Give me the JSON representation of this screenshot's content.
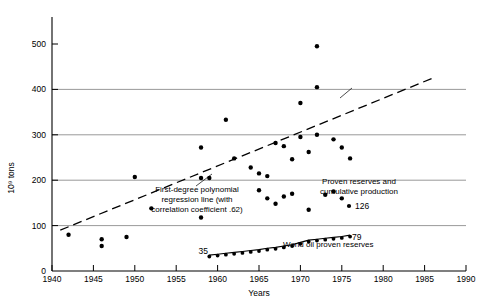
{
  "chart_data": {
    "type": "scatter",
    "title": "",
    "xlabel": "Years",
    "ylabel": "10⁹ tons",
    "xlim": [
      1940,
      1990
    ],
    "ylim": [
      0,
      560
    ],
    "grid": "horizontal gridlines at 100, 200, 300, 400",
    "legend_position": "inline annotations",
    "x_ticks": [
      1940,
      1945,
      1950,
      1955,
      1960,
      1965,
      1970,
      1975,
      1980,
      1985,
      1990
    ],
    "y_ticks": [
      0,
      100,
      200,
      300,
      400,
      500
    ],
    "series": [
      {
        "name": "Proven reserves and cumulative production",
        "type": "scatter",
        "points": [
          [
            1942,
            80
          ],
          [
            1946,
            55
          ],
          [
            1946,
            70
          ],
          [
            1949,
            75
          ],
          [
            1950,
            207
          ],
          [
            1952,
            138
          ],
          [
            1958,
            118
          ],
          [
            1958,
            205
          ],
          [
            1958,
            272
          ],
          [
            1959,
            205
          ],
          [
            1961,
            333
          ],
          [
            1962,
            248
          ],
          [
            1964,
            228
          ],
          [
            1965,
            215
          ],
          [
            1965,
            178
          ],
          [
            1966,
            160
          ],
          [
            1966,
            209
          ],
          [
            1967,
            148
          ],
          [
            1967,
            282
          ],
          [
            1968,
            164
          ],
          [
            1968,
            275
          ],
          [
            1969,
            170
          ],
          [
            1969,
            246
          ],
          [
            1970,
            295
          ],
          [
            1970,
            370
          ],
          [
            1971,
            135
          ],
          [
            1971,
            262
          ],
          [
            1972,
            300
          ],
          [
            1972,
            405
          ],
          [
            1972,
            495
          ],
          [
            1973,
            168
          ],
          [
            1974,
            175
          ],
          [
            1974,
            290
          ],
          [
            1975,
            160
          ],
          [
            1975,
            272
          ],
          [
            1976,
            248
          ]
        ]
      },
      {
        "name": "World oil proven reserves",
        "type": "line",
        "start_label": "35",
        "end_label": "79",
        "points": [
          [
            1959,
            35
          ],
          [
            1960,
            37
          ],
          [
            1961,
            39
          ],
          [
            1962,
            41
          ],
          [
            1963,
            43
          ],
          [
            1964,
            45
          ],
          [
            1965,
            47
          ],
          [
            1966,
            50
          ],
          [
            1967,
            52
          ],
          [
            1968,
            55
          ],
          [
            1969,
            58
          ],
          [
            1970,
            63
          ],
          [
            1971,
            68
          ],
          [
            1972,
            70
          ],
          [
            1973,
            72
          ],
          [
            1974,
            74
          ],
          [
            1975,
            76
          ],
          [
            1976,
            79
          ]
        ]
      },
      {
        "name": "First-degree polynomial regression line",
        "type": "line",
        "correlation_coefficient": ".62",
        "points": [
          [
            1941,
            90
          ],
          [
            1986,
            425
          ]
        ]
      }
    ],
    "annotations": [
      {
        "name": "regression-annotation",
        "lines": [
          "First-degree polynomial",
          "regression line (with",
          "correlation coefficient .62)"
        ]
      },
      {
        "name": "proven-reserves-annotation",
        "lines": [
          "Proven reserves and",
          "cumulative production"
        ],
        "marker_value": "126"
      },
      {
        "name": "world-oil-annotation",
        "lines": [
          "World oil proven reserves"
        ]
      }
    ]
  },
  "axes": {
    "y_label": "10⁹ tons",
    "x_label": "Years",
    "y_ticks": [
      "0",
      "100",
      "200",
      "300",
      "400",
      "500"
    ],
    "x_ticks": [
      "1940",
      "1945",
      "1950",
      "1955",
      "1960",
      "1965",
      "1970",
      "1975",
      "1980",
      "1985",
      "1990"
    ]
  },
  "annotations": {
    "regression_line_1": "First-degree polynomial",
    "regression_line_2": "regression line (with",
    "regression_line_3": "correlation coefficient .62)",
    "proven_line_1": "Proven reserves and",
    "proven_line_2": "cumulative production",
    "proven_marker_value": "126",
    "world_oil_label": "World oil proven reserves",
    "curve_start_value": "35",
    "curve_end_value": "79"
  },
  "colors": {
    "ink": "#000000",
    "grid": "#8d8d8d",
    "background": "#ffffff"
  }
}
